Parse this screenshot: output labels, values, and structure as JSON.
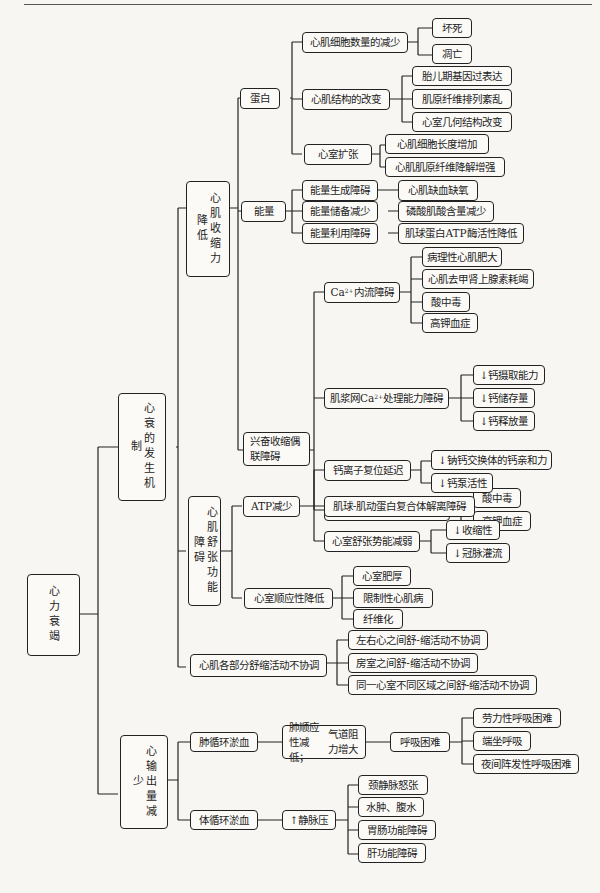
{
  "diagram": {
    "root": "心力衰竭",
    "level1": {
      "mechanism": "心衰的发生机制",
      "output": "心输出量减少"
    },
    "mechanism": {
      "contraction": "心肌收缩力降低",
      "diastolic": "心肌舒张功能障碍",
      "discoordination": "心肌各部分舒缩活动不协调"
    },
    "contraction": {
      "protein": "蛋白",
      "energy": "能量",
      "ec_coupling": "兴奋收缩偶联障碍"
    },
    "protein": {
      "cell_loss": "心肌细胞数量的减少",
      "cell_loss_items": [
        "坏死",
        "凋亡"
      ],
      "structure": "心肌结构的改变",
      "structure_items": [
        "胎儿期基因过表达",
        "肌原纤维排列紊乱",
        "心室几何结构改变"
      ],
      "dilation": "心室扩张",
      "dilation_items": [
        "心肌细胞长度增加",
        "心肌肌原纤维降解增强"
      ]
    },
    "energy": {
      "items": [
        {
          "label": "能量生成障碍",
          "child": "心肌缺血缺氧"
        },
        {
          "label": "能量储备减少",
          "child": "磷酸肌酸含量减少"
        },
        {
          "label": "能量利用障碍",
          "child": "肌球蛋白ATP酶活性降低"
        }
      ]
    },
    "ec_coupling": {
      "influx": {
        "pre": "Ca",
        "sup": "2+",
        "post": "内流障碍"
      },
      "influx_items": [
        "病理性心肌肥大",
        "心肌去甲肾上腺素耗竭",
        "酸中毒",
        "高钾血症"
      ],
      "sr": {
        "pre": "肌浆网Ca",
        "sup": "2+",
        "post": "处理能力障碍"
      },
      "sr_items": [
        "↓钙摄取能力",
        "↓钙储存量",
        "↓钙释放量"
      ],
      "troponin": {
        "pre": "Ca",
        "sup": "2+",
        "post": "与肌钙蛋白结合障碍"
      },
      "troponin_items": [
        "酸中毒",
        "高钾血症"
      ]
    },
    "diastolic": {
      "atp": "ATP减少",
      "atp_children": {
        "calcium_reset": "钙离子复位延迟",
        "calcium_reset_items": [
          "↓钠钙交换体的钙亲和力",
          "↓钙泵活性"
        ],
        "dissociation": "肌球-肌动蛋白复合体解离障碍",
        "potential": "心室舒张势能减弱",
        "potential_items": [
          "↓收缩性",
          "↓冠脉灌流"
        ]
      },
      "compliance": "心室顺应性降低",
      "compliance_items": [
        "心室肥厚",
        "限制性心肌病",
        "纤维化"
      ]
    },
    "discoordination": {
      "items": [
        "左右心之间舒-缩活动不协调",
        "房室之间舒-缩活动不协调",
        "同一心室不同区域之间舒-缩活动不协调"
      ]
    },
    "output": {
      "pulmonary": "肺循环淤血",
      "pulmonary_cause_line1": "肺顺应性减低；",
      "pulmonary_cause_line2": "气道阻力增大",
      "dyspnea": "呼吸困难",
      "dyspnea_items": [
        "劳力性呼吸困难",
        "端坐呼吸",
        "夜间阵发性呼吸困难"
      ],
      "systemic": "体循环淤血",
      "venous": "↑静脉压",
      "venous_items": [
        "颈静脉怒张",
        "水肿、腹水",
        "胃肠功能障碍",
        "肝功能障碍"
      ]
    }
  }
}
